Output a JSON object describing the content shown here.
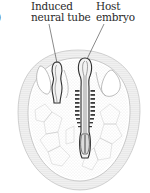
{
  "figure": {
    "panel_marker_partial": ")",
    "labels": {
      "induced_line1": "Induced",
      "induced_line2": "neural tube",
      "host_line1": "Host",
      "host_line2": "embryo"
    },
    "colors": {
      "ink": "#2a2a2a",
      "stipple": "#9a9a9a",
      "light": "#c8c8c8"
    }
  }
}
